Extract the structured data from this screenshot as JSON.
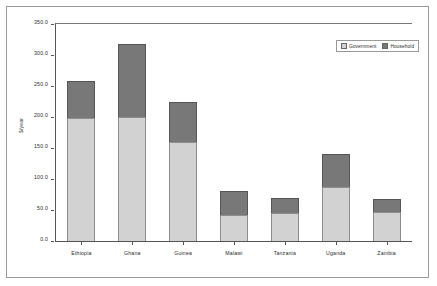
{
  "chart_data": {
    "type": "bar",
    "subtype": "stacked-bar",
    "title": "",
    "xlabel": "",
    "ylabel": "$/year",
    "ylim": [
      0,
      350
    ],
    "ytick_step": 50,
    "ytick_labels": [
      "350.0",
      "300.0",
      "250.0",
      "200.0",
      "150.0",
      "100.0",
      "50.0",
      "0.0"
    ],
    "ytick_values": [
      350,
      300,
      250,
      200,
      150,
      100,
      50,
      0
    ],
    "grid": false,
    "legend_position": "top-right",
    "categories": [
      "Ethiopia",
      "Ghana",
      "Guinea",
      "Malawi",
      "Tanzania",
      "Uganda",
      "Zambia"
    ],
    "series": [
      {
        "name": "Government",
        "color": "#d2d2d2",
        "values": [
          199,
          200,
          160,
          42,
          45,
          87,
          47
        ]
      },
      {
        "name": "Household",
        "color": "#787878",
        "values": [
          59,
          118,
          64,
          39,
          24,
          53,
          21
        ]
      }
    ],
    "totals": [
      258,
      318,
      224,
      81,
      69,
      140,
      68
    ]
  },
  "legend": {
    "items": [
      {
        "label": "Government",
        "swatch": "government"
      },
      {
        "label": "Household",
        "swatch": "household"
      }
    ]
  },
  "axis": {
    "y_title": "$/year"
  },
  "colors": {
    "government": "#d2d2d2",
    "household": "#787878",
    "frame": "#9a9a9a",
    "axis": "#555555",
    "text": "#2b2b2b"
  }
}
